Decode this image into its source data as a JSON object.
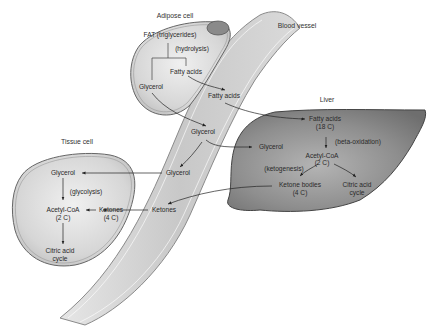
{
  "diagram": {
    "compartments": {
      "adipose": "Adipose cell",
      "blood_vessel": "Blood vessel",
      "liver": "Liver",
      "tissue": "Tissue cell"
    },
    "adipose": {
      "fat": "FAT (triglycerides)",
      "hydrolysis": "(hydrolysis)",
      "fatty_acids": "Fatty acids",
      "glycerol": "Glycerol"
    },
    "blood": {
      "fatty_acids": "Fatty acids",
      "glycerol_1": "Glycerol",
      "glycerol_2": "Glycerol",
      "ketones": "Ketones"
    },
    "liver": {
      "fatty_acids": "Fatty acids",
      "fatty_acids_c": "(18 C)",
      "beta_oxidation": "(beta-oxidation)",
      "acetyl_coa": "Acetyl-CoA",
      "acetyl_coa_c": "(2 C)",
      "ketogenesis": "(ketogenesis)",
      "ketone_bodies": "Ketone bodies",
      "ketone_bodies_c": "(4 C)",
      "citric_1": "Citric acid",
      "citric_2": "cycle",
      "glycerol": "Glycerol"
    },
    "tissue": {
      "glycerol": "Glycerol",
      "glycolysis": "(glycolysis)",
      "acetyl_coa": "Acetyl-CoA",
      "acetyl_coa_c": "(2 C)",
      "ketones": "Ketones",
      "ketones_c": "(4 C)",
      "citric_1": "Citric acid",
      "citric_2": "cycle"
    },
    "colors": {
      "liver_fill": "#8a8a8a",
      "cell_fill": "#d2d2d2",
      "vessel_fill": "#cfcfcf",
      "outline": "#555555",
      "text": "#2a2a2a"
    }
  }
}
